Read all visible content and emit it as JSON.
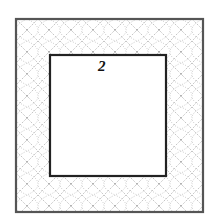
{
  "figure": {
    "label": "2",
    "outer_frame_color": "#444444",
    "inner_frame_color": "#222222",
    "pattern_color": "#888888",
    "pattern": "dotted-lattice-border"
  }
}
